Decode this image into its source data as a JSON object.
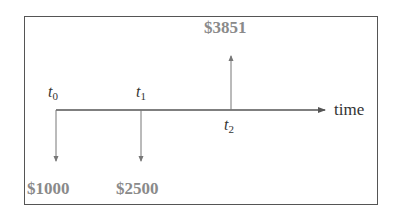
{
  "diagram": {
    "type": "cash-flow-timeline",
    "axis_label": "time",
    "points": [
      {
        "id": "t0",
        "symbol": "t",
        "subscript": "0",
        "amount": "$1000",
        "direction": "down"
      },
      {
        "id": "t1",
        "symbol": "t",
        "subscript": "1",
        "amount": "$2500",
        "direction": "down"
      },
      {
        "id": "t2",
        "symbol": "t",
        "subscript": "2",
        "amount": "$3851",
        "direction": "up"
      }
    ],
    "colors": {
      "frame": "#555555",
      "lines": "#555555",
      "amount_text": "#8a8a8a",
      "label_text": "#333333"
    }
  }
}
